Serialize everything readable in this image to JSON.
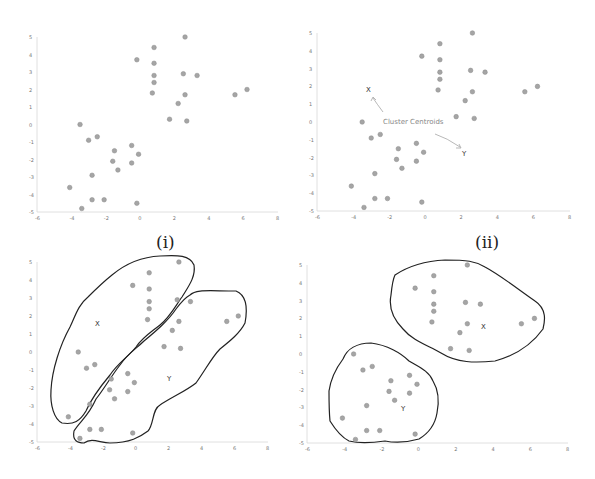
{
  "figure": {
    "panels": [
      {
        "id": "top-left",
        "caption": "",
        "description": "Unlabeled scatter of data points"
      },
      {
        "id": "top-right",
        "caption": "",
        "annotation": "Cluster Centroids",
        "centroids": [
          {
            "label": "X",
            "x": -3.1,
            "y": 1.9
          },
          {
            "label": "Y",
            "x": 2.2,
            "y": -1.6
          }
        ]
      },
      {
        "id": "bottom-left",
        "caption": "(i)",
        "centroids": [
          {
            "label": "X",
            "x": -2.1,
            "y": 1.6
          },
          {
            "label": "Y",
            "x": 2.0,
            "y": -1.5
          }
        ]
      },
      {
        "id": "bottom-right",
        "caption": "(ii)",
        "centroids": [
          {
            "label": "X",
            "x": 3.5,
            "y": 1.6
          },
          {
            "label": "Y",
            "x": -0.8,
            "y": -3.0
          }
        ]
      }
    ],
    "captions": {
      "i": "(i)",
      "ii": "(ii)"
    },
    "annotation_text": "Cluster Centroids",
    "centroid_labels": {
      "x": "X",
      "y": "Y"
    }
  },
  "axes": {
    "x_ticks": [
      "-6",
      "-4",
      "-2",
      "0",
      "2",
      "4",
      "6",
      "8"
    ],
    "y_ticks": [
      "5",
      "4",
      "3",
      "2",
      "1",
      "0",
      "-1",
      "-2",
      "-3",
      "-4",
      "-5"
    ],
    "xlim": [
      -6,
      8
    ],
    "ylim": [
      -5,
      5
    ]
  },
  "points": [
    [
      0.8,
      4.4
    ],
    [
      2.6,
      5.0
    ],
    [
      -0.2,
      3.7
    ],
    [
      0.8,
      3.5
    ],
    [
      0.8,
      2.8
    ],
    [
      2.5,
      2.9
    ],
    [
      3.3,
      2.8
    ],
    [
      0.8,
      2.4
    ],
    [
      0.7,
      1.8
    ],
    [
      2.6,
      1.7
    ],
    [
      5.5,
      1.7
    ],
    [
      6.2,
      2.0
    ],
    [
      2.2,
      1.2
    ],
    [
      1.7,
      0.3
    ],
    [
      2.7,
      0.2
    ],
    [
      -3.5,
      0.0
    ],
    [
      -3.0,
      -0.9
    ],
    [
      -2.5,
      -0.7
    ],
    [
      -1.5,
      -1.5
    ],
    [
      -0.5,
      -1.2
    ],
    [
      -0.1,
      -1.7
    ],
    [
      -1.6,
      -2.1
    ],
    [
      -0.5,
      -2.2
    ],
    [
      -1.3,
      -2.6
    ],
    [
      -2.8,
      -2.9
    ],
    [
      -4.1,
      -3.6
    ],
    [
      -2.8,
      -4.3
    ],
    [
      -2.1,
      -4.3
    ],
    [
      -0.2,
      -4.5
    ],
    [
      -3.4,
      -4.8
    ]
  ],
  "colors": {
    "point": "#a5a5a5",
    "hull": "#222222",
    "axis": "#d8d8d8"
  }
}
